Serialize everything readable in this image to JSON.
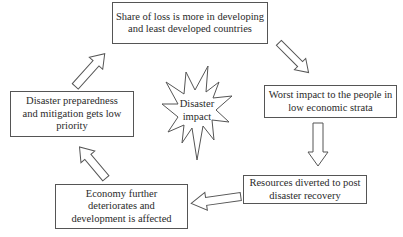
{
  "diagram": {
    "type": "cycle",
    "center": {
      "lines": [
        "Disaster",
        "impact"
      ]
    },
    "nodes": [
      {
        "id": "share-of-loss",
        "lines": [
          "Share of loss is more in developing",
          "and least developed countries"
        ]
      },
      {
        "id": "worst-impact",
        "lines": [
          "Worst impact to the people in",
          "low economic strata"
        ]
      },
      {
        "id": "resources-diverted",
        "lines": [
          "Resources diverted to post",
          "disaster recovery"
        ]
      },
      {
        "id": "economy-deteriorates",
        "lines": [
          "Economy further",
          "deteriorates and",
          "development is affected"
        ]
      },
      {
        "id": "preparedness-low",
        "lines": [
          "Disaster preparedness",
          "and mitigation gets low",
          "priority"
        ]
      }
    ],
    "edges": [
      {
        "from": "share-of-loss",
        "to": "worst-impact"
      },
      {
        "from": "worst-impact",
        "to": "resources-diverted"
      },
      {
        "from": "resources-diverted",
        "to": "economy-deteriorates"
      },
      {
        "from": "economy-deteriorates",
        "to": "preparedness-low"
      },
      {
        "from": "preparedness-low",
        "to": "share-of-loss"
      }
    ]
  }
}
